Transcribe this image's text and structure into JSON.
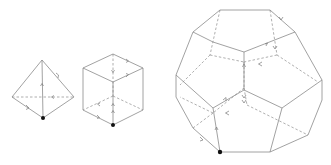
{
  "figure": {
    "colors": {
      "edge": "#8a8a8a",
      "hidden_edge": "#9a9a9a",
      "arrow": "#7a7a7a",
      "base_point": "#111111",
      "background": "#ffffff"
    },
    "shapes": [
      {
        "name": "tetrahedron",
        "base_point": [
          43,
          118
        ]
      },
      {
        "name": "cube",
        "base_point": [
          113,
          125
        ]
      },
      {
        "name": "dodecahedron",
        "base_point": [
          220,
          152
        ]
      }
    ]
  }
}
